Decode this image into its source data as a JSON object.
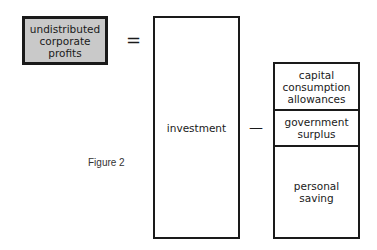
{
  "figure": {
    "caption": "Figure 2",
    "left_term": "undistributed\ncorporate\nprofits",
    "equals_sign": "=",
    "middle_term": "investment",
    "minus_sign": "—",
    "right_terms": [
      {
        "label": "capital\nconsumption\nallowances"
      },
      {
        "label": "government\nsurplus"
      },
      {
        "label": "personal\nsaving"
      }
    ],
    "colors": {
      "highlight_fill": "#c9c9c9",
      "stroke": "#1a1a1a"
    }
  }
}
